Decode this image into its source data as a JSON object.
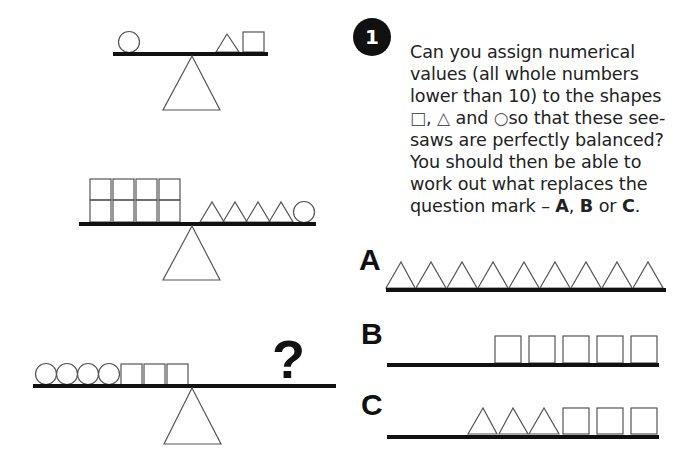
{
  "puzzle": {
    "number": "1",
    "question_parts": {
      "line1": "Can you assign numerical values (all whole numbers lower than 10) to the shapes ",
      "square_glyph": "□",
      "comma": ", ",
      "triangle_glyph": "△",
      "and": " and ",
      "circle_glyph": "○",
      "line2": "so that these see-saws are perfectly balanced? You should then be able to work out what replaces the question mark – ",
      "opt_a": "A",
      "sep1": ", ",
      "opt_b": "B",
      "or": " or ",
      "opt_c": "C",
      "end": "."
    },
    "question_mark": "?",
    "seesaws": [
      {
        "left": [
          "circle"
        ],
        "right": [
          "triangle",
          "square"
        ]
      },
      {
        "left": [
          "square-stack-2",
          "square-stack-2",
          "square-stack-2",
          "square-stack-2"
        ],
        "right": [
          "triangle",
          "triangle",
          "triangle",
          "triangle",
          "circle"
        ]
      },
      {
        "left": [
          "circle",
          "circle",
          "circle",
          "circle",
          "square",
          "square",
          "square"
        ],
        "right": [
          "?"
        ]
      }
    ],
    "options": [
      {
        "label": "A",
        "shapes": [
          "triangle",
          "triangle",
          "triangle",
          "triangle",
          "triangle",
          "triangle",
          "triangle",
          "triangle",
          "triangle"
        ]
      },
      {
        "label": "B",
        "shapes": [
          "square",
          "square",
          "square",
          "square",
          "square"
        ]
      },
      {
        "label": "C",
        "shapes": [
          "triangle",
          "triangle",
          "triangle",
          "square",
          "square",
          "square"
        ]
      }
    ]
  },
  "colors": {
    "ink": "#111111",
    "outline": "#555555",
    "background": "#ffffff"
  }
}
